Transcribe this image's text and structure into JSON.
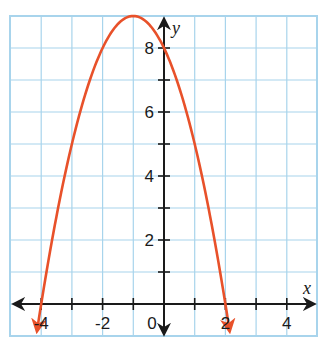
{
  "chart_data": {
    "type": "line",
    "title": "",
    "xlabel": "x",
    "ylabel": "y",
    "xlim": [
      -5,
      5
    ],
    "ylim": [
      -1,
      9
    ],
    "grid": true,
    "grid_step": 1,
    "x_tick_labels": [
      {
        "value": -4,
        "label": "-4"
      },
      {
        "value": -2,
        "label": "-2"
      },
      {
        "value": 0,
        "label": "0"
      },
      {
        "value": 2,
        "label": "2"
      },
      {
        "value": 4,
        "label": "4"
      }
    ],
    "y_tick_labels": [
      {
        "value": 2,
        "label": "2"
      },
      {
        "value": 4,
        "label": "4"
      },
      {
        "value": 6,
        "label": "6"
      },
      {
        "value": 8,
        "label": "8"
      }
    ],
    "series": [
      {
        "name": "parabola",
        "equation": "y = -(x + 1)^2 + 9",
        "color": "#e8512a",
        "arrows_both_ends": true,
        "vertex": [
          -1,
          9
        ],
        "x_intercepts": [
          -4,
          2
        ],
        "y_intercept": 8,
        "x": [
          -4.13,
          -4,
          -3.5,
          -3,
          -2.5,
          -2,
          -1.5,
          -1,
          -0.5,
          0,
          0.5,
          1,
          1.5,
          2,
          2.13
        ],
        "y": [
          -0.8,
          0,
          2.75,
          5,
          6.75,
          8,
          8.75,
          9,
          8.75,
          8,
          6.75,
          5,
          2.75,
          0,
          -0.8
        ]
      }
    ]
  },
  "colors": {
    "grid": "#a8d4ec",
    "axis": "#1a1a1a",
    "curve": "#e8512a"
  }
}
